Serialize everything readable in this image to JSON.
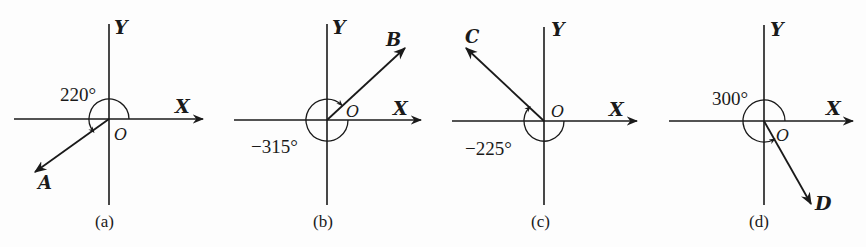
{
  "figure": {
    "axis_x_label": "X",
    "axis_y_label": "Y",
    "origin_label": "O",
    "panels": [
      {
        "id": "a",
        "caption": "(a)",
        "vector_label": "A",
        "angle_text": "220°",
        "angle_deg": 220
      },
      {
        "id": "b",
        "caption": "(b)",
        "vector_label": "B",
        "angle_text": "−315°",
        "angle_deg": -315
      },
      {
        "id": "c",
        "caption": "(c)",
        "vector_label": "C",
        "angle_text": "−225°",
        "angle_deg": -225
      },
      {
        "id": "d",
        "caption": "(d)",
        "vector_label": "D",
        "angle_text": "300°",
        "angle_deg": 300
      }
    ]
  },
  "colors": {
    "ink": "#1a1a1a",
    "paper": "#fdfdfd"
  }
}
